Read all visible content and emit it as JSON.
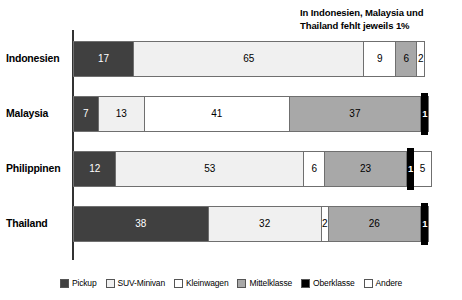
{
  "annotation": {
    "line1": "In Indonesien, Malaysia und",
    "line2": "Thailand fehlt jeweils 1%"
  },
  "legend": {
    "items": [
      {
        "label": "Pickup",
        "key": "pickup",
        "color": "#404040"
      },
      {
        "label": "SUV-Minivan",
        "key": "suv",
        "color": "#f0f0f0"
      },
      {
        "label": "Kleinwagen",
        "key": "klein",
        "color": "#ffffff"
      },
      {
        "label": "Mittelklasse",
        "key": "mittel",
        "color": "#a8a8a8"
      },
      {
        "label": "Oberklasse",
        "key": "ober",
        "color": "#000000"
      },
      {
        "label": "Andere",
        "key": "andere",
        "color": "#ffffff"
      }
    ]
  },
  "chart_data": {
    "type": "bar",
    "orientation": "horizontal",
    "stacked": true,
    "title": "",
    "xlabel": "",
    "ylabel": "",
    "xlim": [
      0,
      100
    ],
    "grid": false,
    "legend_position": "bottom",
    "categories": [
      "Indonesien",
      "Malaysia",
      "Philippinen",
      "Thailand"
    ],
    "series": [
      {
        "name": "Pickup",
        "values": [
          17,
          7,
          12,
          38
        ]
      },
      {
        "name": "SUV-Minivan",
        "values": [
          65,
          13,
          53,
          32
        ]
      },
      {
        "name": "Kleinwagen",
        "values": [
          9,
          41,
          6,
          2
        ]
      },
      {
        "name": "Mittelklasse",
        "values": [
          6,
          37,
          23,
          26
        ]
      },
      {
        "name": "Oberklasse",
        "values": [
          0,
          1,
          1,
          1
        ]
      },
      {
        "name": "Andere",
        "values": [
          2,
          0,
          5,
          0
        ]
      }
    ],
    "annotations": [
      "In Indonesien, Malaysia und Thailand fehlt jeweils 1%"
    ],
    "rows": [
      {
        "label": "Indonesien",
        "total": 99,
        "segments": [
          {
            "key": "pickup",
            "label": "17",
            "value": 17
          },
          {
            "key": "suv",
            "label": "65",
            "value": 65
          },
          {
            "key": "klein",
            "label": "9",
            "value": 9
          },
          {
            "key": "mittel",
            "label": "6",
            "value": 6
          },
          {
            "key": "andere",
            "label": "2",
            "value": 2
          }
        ]
      },
      {
        "label": "Malaysia",
        "total": 99,
        "segments": [
          {
            "key": "pickup",
            "label": "7",
            "value": 7
          },
          {
            "key": "suv",
            "label": "13",
            "value": 13
          },
          {
            "key": "klein",
            "label": "41",
            "value": 41
          },
          {
            "key": "mittel",
            "label": "37",
            "value": 37
          },
          {
            "key": "ober",
            "label": "1",
            "value": 1
          }
        ]
      },
      {
        "label": "Philippinen",
        "total": 100,
        "segments": [
          {
            "key": "pickup",
            "label": "12",
            "value": 12
          },
          {
            "key": "suv",
            "label": "53",
            "value": 53
          },
          {
            "key": "klein",
            "label": "6",
            "value": 6
          },
          {
            "key": "mittel",
            "label": "23",
            "value": 23
          },
          {
            "key": "ober",
            "label": "1",
            "value": 1
          },
          {
            "key": "andere",
            "label": "5",
            "value": 5
          }
        ]
      },
      {
        "label": "Thailand",
        "total": 99,
        "segments": [
          {
            "key": "pickup",
            "label": "38",
            "value": 38
          },
          {
            "key": "suv",
            "label": "32",
            "value": 32
          },
          {
            "key": "klein",
            "label": "2",
            "value": 2
          },
          {
            "key": "mittel",
            "label": "26",
            "value": 26
          },
          {
            "key": "ober",
            "label": "1",
            "value": 1
          }
        ]
      }
    ]
  }
}
